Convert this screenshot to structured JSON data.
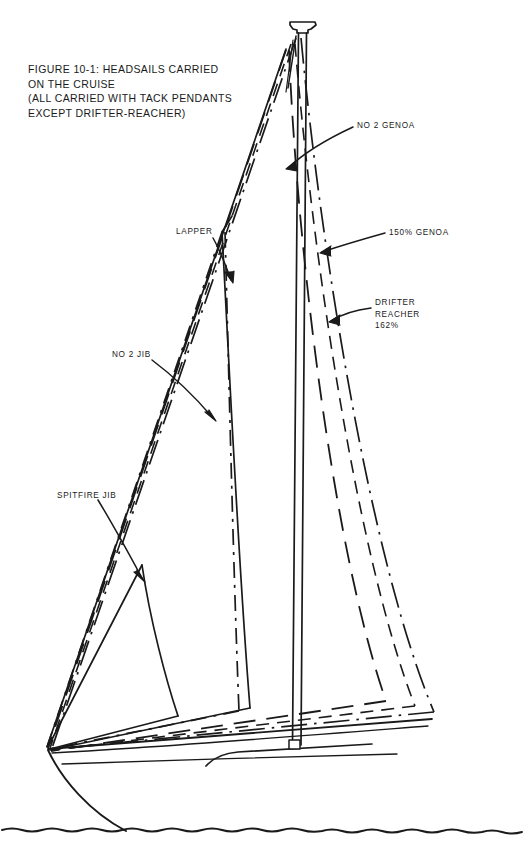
{
  "figure": {
    "id": "FIGURE 10-1",
    "title_lines": [
      "FIGURE 10-1: HEADSAILS CARRIED",
      "ON THE CRUISE",
      "(ALL CARRIED WITH TACK PENDANTS",
      "EXCEPT DRIFTER-REACHER)"
    ],
    "title_text": "FIGURE 10-1: HEADSAILS CARRIED\nON THE CRUISE\n(ALL CARRIED WITH TACK PENDANTS\nEXCEPT DRIFTER-REACHER)",
    "orientation": "bow-left",
    "ink_color": "#1a1a1a",
    "background_color": "#ffffff"
  },
  "labels": {
    "no2_genoa": "NO 2 GENOA",
    "genoa_150": "150% GENOA",
    "drifter_reacher": "DRIFTER\nREACHER\n162%",
    "drifter_line1": "DRIFTER",
    "drifter_line2": "REACHER",
    "drifter_line3": "162%",
    "lapper": "LAPPER",
    "no2_jib": "NO 2 JIB",
    "spitfire_jib": "SPITFIRE JIB"
  },
  "sails": [
    {
      "name": "SPITFIRE JIB",
      "line_style": "solid",
      "size_percent": null,
      "order": 1
    },
    {
      "name": "NO 2 JIB",
      "line_style": "dash-dot",
      "size_percent": null,
      "order": 2
    },
    {
      "name": "LAPPER",
      "line_style": "solid",
      "size_percent": null,
      "order": 3
    },
    {
      "name": "NO 2 GENOA",
      "line_style": "long-dash",
      "size_percent": null,
      "order": 4
    },
    {
      "name": "150% GENOA",
      "line_style": "dash",
      "size_percent": 150,
      "order": 5
    },
    {
      "name": "DRIFTER REACHER",
      "line_style": "dash-dot-dot",
      "size_percent": 162,
      "order": 6
    }
  ],
  "vessel": {
    "mast": "single-masthead-rig",
    "masthead_fitting": "masthead-crane",
    "waterline": "wavy-water-line",
    "deck_fitting": "mast-step-box"
  }
}
